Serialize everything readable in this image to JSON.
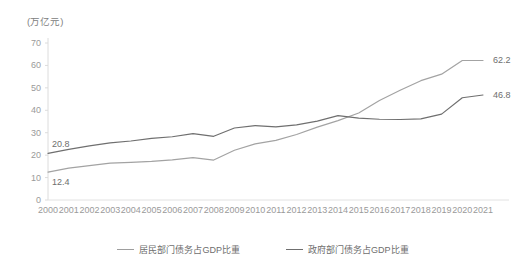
{
  "chart_data": {
    "type": "line",
    "title": "",
    "subtitle": "",
    "unit_label": "(万亿元)",
    "xlabel": "",
    "ylabel": "",
    "ylim": [
      0,
      70
    ],
    "yticks": [
      0,
      10,
      20,
      30,
      40,
      50,
      60,
      70
    ],
    "grid": false,
    "legend_position": "bottom",
    "categories": [
      "2000",
      "2001",
      "2002",
      "2003",
      "2004",
      "2005",
      "2006",
      "2007",
      "2008",
      "2009",
      "2010",
      "2011",
      "2012",
      "2013",
      "2014",
      "2015",
      "2016",
      "2017",
      "2018",
      "2019",
      "2020",
      "2021"
    ],
    "series": [
      {
        "name": "居民部门债务占GDP比重",
        "color": "#a3a3a3",
        "values": [
          12.4,
          14.2,
          15.3,
          16.4,
          16.8,
          17.2,
          17.9,
          18.9,
          17.8,
          22.2,
          25.0,
          26.6,
          29.2,
          32.5,
          35.4,
          38.8,
          44.4,
          48.9,
          53.2,
          56.1,
          62.2,
          62.2
        ],
        "labels": {
          "2000": "12.4",
          "2021": "62.2"
        }
      },
      {
        "name": "政府部门债务占GDP比重",
        "color": "#6f6f6f",
        "values": [
          20.8,
          22.6,
          24.1,
          25.5,
          26.3,
          27.5,
          28.2,
          29.6,
          28.4,
          32.1,
          33.2,
          32.6,
          33.5,
          35.2,
          37.6,
          36.5,
          36.0,
          35.9,
          36.2,
          38.3,
          45.6,
          46.8
        ],
        "labels": {
          "2000": "20.8",
          "2021": "46.8"
        }
      }
    ]
  },
  "legend": {
    "items": [
      {
        "label": "居民部门债务占GDP比重"
      },
      {
        "label": "政府部门债务占GDP比重"
      }
    ]
  },
  "annotations": {
    "start_residential": "12.4",
    "start_government": "20.8",
    "end_residential": "62.2",
    "end_government": "46.8"
  }
}
